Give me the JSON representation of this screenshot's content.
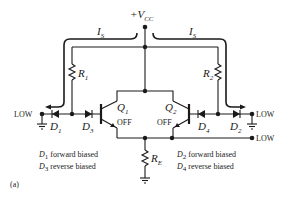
{
  "supply": {
    "label": "+V",
    "sub": "CC"
  },
  "currents": [
    {
      "id": "left",
      "label": "I",
      "sub": "S"
    },
    {
      "id": "right",
      "label": "I",
      "sub": "S"
    }
  ],
  "resistors": [
    {
      "id": "R1",
      "label": "R",
      "sub": "1"
    },
    {
      "id": "R2",
      "label": "R",
      "sub": "2"
    },
    {
      "id": "RE",
      "label": "R",
      "sub": "E"
    }
  ],
  "diodes": [
    {
      "id": "D1",
      "label": "D",
      "sub": "1"
    },
    {
      "id": "D3",
      "label": "D",
      "sub": "3"
    },
    {
      "id": "D4",
      "label": "D",
      "sub": "4"
    },
    {
      "id": "D2",
      "label": "D",
      "sub": "2"
    }
  ],
  "transistors": [
    {
      "id": "Q1",
      "label": "Q",
      "sub": "1",
      "state": "OFF"
    },
    {
      "id": "Q2",
      "label": "Q",
      "sub": "2",
      "state": "OFF"
    }
  ],
  "inputs": {
    "left": "LOW",
    "right": "LOW",
    "output": "LOW"
  },
  "notes": {
    "left_line1_d": "D",
    "left_line1_sub": "1",
    "left_line1_text": " forward biased",
    "left_line2_d": "D",
    "left_line2_sub": "3",
    "left_line2_text": " reverse biased",
    "right_line1_d": "D",
    "right_line1_sub": "2",
    "right_line1_text": " forward biased",
    "right_line2_d": "D",
    "right_line2_sub": "4",
    "right_line2_text": " reverse biased"
  },
  "figure_label": "(a)"
}
